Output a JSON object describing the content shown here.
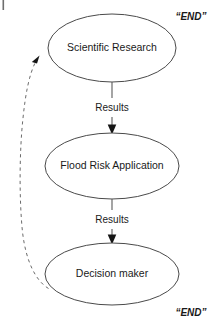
{
  "figure": {
    "width": 223,
    "height": 330,
    "background_color": "#ffffff",
    "node_stroke_color": "#4a4a4a",
    "edge_color": "#5a5a5a",
    "feedback_color": "#6b6b6b",
    "text_color": "#1a1a1a"
  },
  "nodes": [
    {
      "id": "scientific-research",
      "label": "Scientific Research",
      "shape": "ellipse",
      "cx": 112,
      "cy": 48,
      "rx": 64,
      "ry": 34
    },
    {
      "id": "flood-risk-application",
      "label": "Flood Risk Application",
      "shape": "ellipse",
      "cx": 112,
      "cy": 166,
      "rx": 67,
      "ry": 33
    },
    {
      "id": "decision-maker",
      "label": "Decision maker",
      "shape": "ellipse",
      "cx": 112,
      "cy": 274,
      "rx": 67,
      "ry": 31
    }
  ],
  "edges": [
    {
      "id": "results-research-to-application",
      "label": "Results",
      "from": "scientific-research",
      "to": "flood-risk-application",
      "style": "solid",
      "arrow": "filled-triangle",
      "label_x": 112,
      "label_y": 108
    },
    {
      "id": "results-application-to-decision",
      "label": "Results",
      "from": "flood-risk-application",
      "to": "decision-maker",
      "style": "solid",
      "arrow": "filled-triangle",
      "label_x": 112,
      "label_y": 220
    },
    {
      "id": "feedback-decision-to-research",
      "label": "",
      "from": "decision-maker",
      "to": "scientific-research",
      "style": "dashed",
      "arrow": "filled-triangle"
    }
  ],
  "annotations": [
    {
      "id": "end-note-top",
      "text": "“END”",
      "x": 191,
      "y": 17
    },
    {
      "id": "end-note-bottom",
      "text": "“END”",
      "x": 191,
      "y": 313
    }
  ]
}
